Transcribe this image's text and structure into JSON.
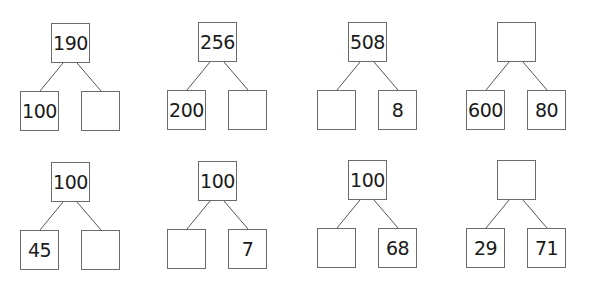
{
  "trees": [
    {
      "top": "190",
      "left": "100",
      "right": ""
    },
    {
      "top": "256",
      "left": "200",
      "right": ""
    },
    {
      "top": "508",
      "left": "",
      "right": "8"
    },
    {
      "top": "",
      "left": "600",
      "right": "80"
    },
    {
      "top": "100",
      "left": "45",
      "right": ""
    },
    {
      "top": "100",
      "left": "",
      "right": "7"
    },
    {
      "top": "100",
      "left": "",
      "right": "68"
    },
    {
      "top": "",
      "left": "29",
      "right": "71"
    }
  ]
}
